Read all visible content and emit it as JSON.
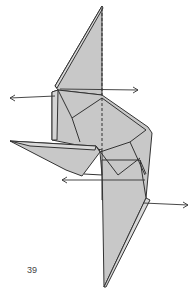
{
  "diagram": {
    "step_number": "39",
    "caption": "",
    "colors": {
      "paper_fill": "#c8c8c8",
      "paper_fill_light": "#d6d6d6",
      "line": "#333333",
      "background": "#ffffff"
    },
    "annotations": [
      {
        "type": "valley-fold-line",
        "description": "vertical dashed center line"
      },
      {
        "type": "arrow",
        "direction": "left",
        "description": "pull left, upper"
      },
      {
        "type": "arrow",
        "direction": "right",
        "description": "pull right, upper"
      },
      {
        "type": "arrow",
        "direction": "left",
        "description": "pull left, lower"
      },
      {
        "type": "arrow",
        "direction": "right",
        "description": "pull right, lower"
      }
    ]
  }
}
